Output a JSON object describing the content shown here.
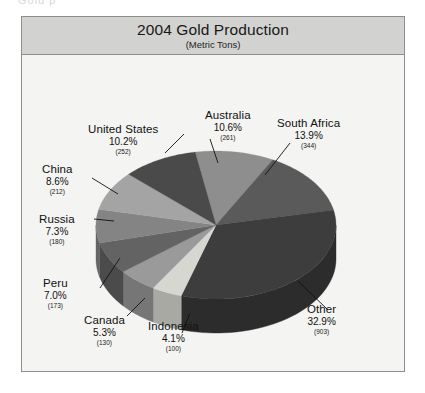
{
  "scan_fragment": "Gold p",
  "frame": {
    "border_color": "#8d8d8d",
    "background": "#f3f3f1",
    "title_band_color": "#d2d2d0"
  },
  "header": {
    "title": "2004 Gold Production",
    "subtitle": "(Metric Tons)"
  },
  "chart_data": {
    "type": "pie",
    "title": "2004 Gold Production",
    "subtitle": "(Metric Tons)",
    "unit": "Metric Tons",
    "value_unit_label": "metric tons",
    "total_value": 2555,
    "legend_position": "none",
    "labels_position": "outside-with-leader-lines",
    "three_d": true,
    "categories": [
      "Australia",
      "South Africa",
      "Other",
      "Indonesia",
      "Canada",
      "Peru",
      "Russia",
      "China",
      "United States"
    ],
    "values": [
      261,
      344,
      903,
      100,
      130,
      173,
      180,
      212,
      252
    ],
    "percentages": [
      10.6,
      13.9,
      32.9,
      4.1,
      5.3,
      7.0,
      7.3,
      8.6,
      10.2
    ],
    "slices": [
      {
        "name": "Australia",
        "percent": "10.6%",
        "value": "(261)",
        "color": "#8e8e8e",
        "side_color": "#6d6d6d"
      },
      {
        "name": "South Africa",
        "percent": "13.9%",
        "value": "(344)",
        "color": "#5a5a5a",
        "side_color": "#434343"
      },
      {
        "name": "Other",
        "percent": "32.9%",
        "value": "(903)",
        "color": "#3d3d3d",
        "side_color": "#2c2c2c"
      },
      {
        "name": "Indonesia",
        "percent": "4.1%",
        "value": "(100)",
        "color": "#d7d7d2",
        "side_color": "#a9a9a4"
      },
      {
        "name": "Canada",
        "percent": "5.3%",
        "value": "(130)",
        "color": "#9a9a9a",
        "side_color": "#767676"
      },
      {
        "name": "Peru",
        "percent": "7.0%",
        "value": "(173)",
        "color": "#636363",
        "side_color": "#4b4b4b"
      },
      {
        "name": "Russia",
        "percent": "7.3%",
        "value": "(180)",
        "color": "#848484",
        "side_color": "#646464"
      },
      {
        "name": "China",
        "percent": "8.6%",
        "value": "(212)",
        "color": "#a4a4a4",
        "side_color": "#7e7e7e"
      },
      {
        "name": "United States",
        "percent": "10.2%",
        "value": "(252)",
        "color": "#4a4a4a",
        "side_color": "#383838"
      }
    ]
  },
  "labels": {
    "united_states": {
      "name": "United States",
      "percent": "10.2%",
      "value": "(252)"
    },
    "china": {
      "name": "China",
      "percent": "8.6%",
      "value": "(212)"
    },
    "russia": {
      "name": "Russia",
      "percent": "7.3%",
      "value": "(180)"
    },
    "peru": {
      "name": "Peru",
      "percent": "7.0%",
      "value": "(173)"
    },
    "canada": {
      "name": "Canada",
      "percent": "5.3%",
      "value": "(130)"
    },
    "indonesia": {
      "name": "Indonesia",
      "percent": "4.1%",
      "value": "(100)"
    },
    "australia": {
      "name": "Australia",
      "percent": "10.6%",
      "value": "(261)"
    },
    "south_africa": {
      "name": "South Africa",
      "percent": "13.9%",
      "value": "(344)"
    },
    "other": {
      "name": "Other",
      "percent": "32.9%",
      "value": "(903)"
    }
  }
}
